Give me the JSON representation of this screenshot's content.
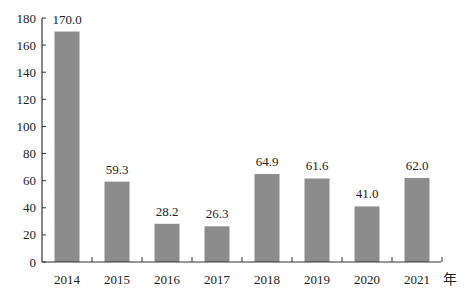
{
  "chart_data": {
    "type": "bar",
    "title": "",
    "xlabel": "年",
    "ylabel": "",
    "categories": [
      "2014",
      "2015",
      "2016",
      "2017",
      "2018",
      "2019",
      "2020",
      "2021"
    ],
    "values": [
      170.0,
      59.3,
      28.2,
      26.3,
      64.9,
      61.6,
      41.0,
      62.0
    ],
    "value_labels": [
      "170.0",
      "59.3",
      "28.2",
      "26.3",
      "64.9",
      "61.6",
      "41.0",
      "62.0"
    ],
    "ylim": [
      0,
      180
    ],
    "yticks": [
      0,
      20,
      40,
      60,
      80,
      100,
      120,
      140,
      160,
      180
    ],
    "grid": false,
    "legend": null,
    "bar_color": "#8c8c8c"
  }
}
